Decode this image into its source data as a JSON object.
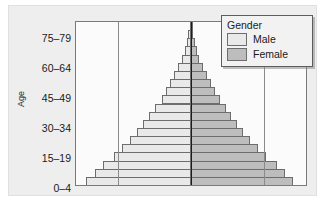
{
  "chart_data": {
    "type": "bar",
    "subtype": "population-pyramid",
    "title": "",
    "xlabel": "",
    "ylabel": "Age",
    "grid": true,
    "legend_position": "top-right",
    "legend_title": "Gender",
    "series": [
      {
        "name": "Male",
        "color": "#e9e9e9",
        "side": "left",
        "values": [
          50,
          46,
          42,
          37,
          33,
          29,
          26,
          23,
          20,
          17,
          14,
          12,
          10,
          8,
          6,
          4.5,
          3,
          2,
          1.2,
          0.6
        ]
      },
      {
        "name": "Female",
        "color": "#bdbdbd",
        "side": "right",
        "values": [
          49,
          45,
          41,
          36,
          32,
          28,
          25,
          22,
          19,
          16.5,
          14,
          11.5,
          9.5,
          7.5,
          5.5,
          4,
          2.8,
          1.8,
          1.1,
          0.6
        ]
      }
    ],
    "categories": [
      "0-4",
      "5-9",
      "10-14",
      "15-19",
      "20-24",
      "25-29",
      "30-34",
      "35-39",
      "40-44",
      "45-49",
      "50-54",
      "55-59",
      "60-64",
      "65-69",
      "70-74",
      "75-79",
      "80-84",
      "85-89",
      "90-94",
      "95-99"
    ],
    "tick_labels": [
      "75-79",
      "60-64",
      "45-49",
      "30-34",
      "15-19",
      "0-4"
    ],
    "tick_positions_px": [
      32,
      62,
      92,
      122,
      152,
      182
    ],
    "gridlines_px": [
      46,
      124,
      202
    ],
    "center_px": 124,
    "xlim": [
      -55,
      55
    ],
    "ylim": [
      0,
      20
    ]
  },
  "axis": {
    "y_title": "Age",
    "labels": [
      {
        "text": "75–79",
        "y": 32
      },
      {
        "text": "60–64",
        "y": 62
      },
      {
        "text": "45–49",
        "y": 92
      },
      {
        "text": "30–34",
        "y": 122
      },
      {
        "text": "15–19",
        "y": 152
      },
      {
        "text": "0–4",
        "y": 182
      }
    ]
  },
  "legend": {
    "title": "Gender",
    "items": [
      {
        "label": "Male",
        "color": "#e9e9e9"
      },
      {
        "label": "Female",
        "color": "#bdbdbd"
      }
    ]
  },
  "colors": {
    "male": "#e9e9e9",
    "female": "#bdbdbd",
    "bar_border": "#6d6d6d",
    "panel_bg": "#eeeeee",
    "plot_bg": "#fbfbfb",
    "grid": "#8a8a8a",
    "center": "#1c1c1c",
    "text": "#1a1a1a"
  }
}
